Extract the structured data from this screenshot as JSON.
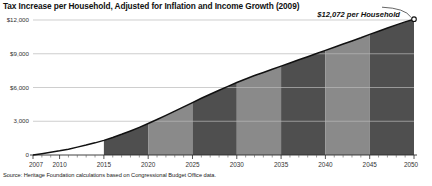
{
  "chart_data": {
    "type": "area",
    "title": "Tax Increase per Household, Adjusted for Inflation and Income Growth (2009)",
    "xlabel": "",
    "ylabel": "",
    "xlim": [
      2007,
      2050
    ],
    "ylim": [
      0,
      12000
    ],
    "grid": true,
    "legend": "none",
    "y_ticks": [
      "0",
      "3,000",
      "$6,000",
      "$9,000",
      "$12,000"
    ],
    "y_tick_values": [
      0,
      3000,
      6000,
      9000,
      12000
    ],
    "x_ticks": [
      "2007",
      "2010",
      "2015",
      "2020",
      "2025",
      "2030",
      "2035",
      "2040",
      "2045",
      "2050"
    ],
    "x_tick_values": [
      2007,
      2010,
      2015,
      2020,
      2025,
      2030,
      2035,
      2040,
      2045,
      2050
    ],
    "annotations": [
      {
        "text": "$12,072 per Household",
        "x": 2050,
        "y": 12072
      }
    ],
    "band_colors": {
      "dark": "#4f4f4f",
      "light": "#8a8a8a",
      "unshaded": "#ffffff"
    },
    "bands": [
      {
        "from": 2015,
        "to": 2020,
        "shade": "dark"
      },
      {
        "from": 2020,
        "to": 2025,
        "shade": "light"
      },
      {
        "from": 2025,
        "to": 2030,
        "shade": "dark"
      },
      {
        "from": 2030,
        "to": 2035,
        "shade": "light"
      },
      {
        "from": 2035,
        "to": 2040,
        "shade": "dark"
      },
      {
        "from": 2040,
        "to": 2045,
        "shade": "light"
      },
      {
        "from": 2045,
        "to": 2050,
        "shade": "dark"
      }
    ],
    "x": [
      2007,
      2008,
      2009,
      2010,
      2011,
      2012,
      2013,
      2014,
      2015,
      2016,
      2017,
      2018,
      2019,
      2020,
      2021,
      2022,
      2023,
      2024,
      2025,
      2026,
      2027,
      2028,
      2029,
      2030,
      2031,
      2032,
      2033,
      2034,
      2035,
      2036,
      2037,
      2038,
      2039,
      2040,
      2041,
      2042,
      2043,
      2044,
      2045,
      2046,
      2047,
      2048,
      2049,
      2050
    ],
    "values": [
      0,
      120,
      240,
      370,
      520,
      700,
      880,
      1080,
      1300,
      1560,
      1840,
      2140,
      2460,
      2800,
      3160,
      3520,
      3900,
      4280,
      4660,
      5040,
      5400,
      5760,
      6100,
      6440,
      6760,
      7060,
      7340,
      7620,
      7900,
      8180,
      8460,
      8740,
      9020,
      9300,
      9580,
      9860,
      10140,
      10420,
      10720,
      11000,
      11290,
      11570,
      11830,
      12072
    ],
    "series": [
      {
        "name": "Tax increase per household",
        "values": [
          0,
          120,
          240,
          370,
          520,
          700,
          880,
          1080,
          1300,
          1560,
          1840,
          2140,
          2460,
          2800,
          3160,
          3520,
          3900,
          4280,
          4660,
          5040,
          5400,
          5760,
          6100,
          6440,
          6760,
          7060,
          7340,
          7620,
          7900,
          8180,
          8460,
          8740,
          9020,
          9300,
          9580,
          9860,
          10140,
          10420,
          10720,
          11000,
          11290,
          11570,
          11830,
          12072
        ]
      }
    ],
    "source": "Source: Heritage Foundation calculations based on Congressional Budget Office data."
  }
}
